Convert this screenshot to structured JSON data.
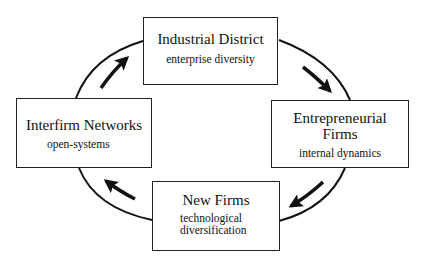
{
  "diagram": {
    "type": "cycle",
    "nodes": [
      {
        "id": "industrial-district",
        "title": "Industrial District",
        "subtitle": "enterprise diversity"
      },
      {
        "id": "entrepreneurial-firms",
        "title": "Entrepreneurial Firms",
        "subtitle": "internal dynamics"
      },
      {
        "id": "new-firms",
        "title": "New Firms",
        "subtitle_lines": [
          "technological",
          "diversification"
        ]
      },
      {
        "id": "interfirm-networks",
        "title": "Interfirm Networks",
        "subtitle": "open-systems"
      }
    ],
    "edges": [
      {
        "from": "interfirm-networks",
        "to": "industrial-district",
        "direction": "clockwise"
      },
      {
        "from": "industrial-district",
        "to": "entrepreneurial-firms",
        "direction": "clockwise"
      },
      {
        "from": "entrepreneurial-firms",
        "to": "new-firms",
        "direction": "clockwise"
      },
      {
        "from": "new-firms",
        "to": "interfirm-networks",
        "direction": "clockwise"
      }
    ],
    "colors": {
      "line": "#111111",
      "box_border": "#222222",
      "background": "#ffffff"
    }
  },
  "labels": {
    "industrial_title": "Industrial District",
    "industrial_sub": "enterprise diversity",
    "entre_title_1": "Entrepreneurial",
    "entre_title_2": "Firms",
    "entre_sub": "internal dynamics",
    "new_title": "New Firms",
    "new_sub_1": "technological",
    "new_sub_2": "diversification",
    "inter_title": "Interfirm Networks",
    "inter_sub": "open-systems"
  }
}
